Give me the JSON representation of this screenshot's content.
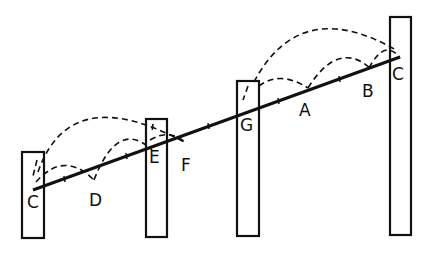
{
  "diagram": {
    "colors": {
      "ink": "#111111",
      "background": "#ffffff"
    },
    "labels": {
      "c_left": "C",
      "d": "D",
      "e": "E",
      "f": "F",
      "g": "G",
      "a": "A",
      "b": "B",
      "c_right": "C"
    },
    "posts": [
      {
        "id": "post-1",
        "x": 22,
        "y": 152,
        "w": 22,
        "h": 86
      },
      {
        "id": "post-2",
        "x": 146,
        "y": 119,
        "w": 21,
        "h": 118
      },
      {
        "id": "post-3",
        "x": 237,
        "y": 81,
        "w": 22,
        "h": 155
      },
      {
        "id": "post-4",
        "x": 390,
        "y": 17,
        "w": 21,
        "h": 218
      }
    ],
    "line": {
      "from": [
        33,
        190
      ],
      "to": [
        400,
        57
      ]
    }
  }
}
